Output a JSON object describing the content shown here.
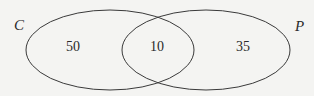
{
  "diagram": {
    "type": "venn",
    "sets": [
      {
        "name": "C",
        "only_count": "50"
      },
      {
        "name": "P",
        "only_count": "35"
      }
    ],
    "intersection_count": "10",
    "colors": {
      "stroke": "#3a3a3a",
      "background": "#f4f4f2"
    }
  }
}
